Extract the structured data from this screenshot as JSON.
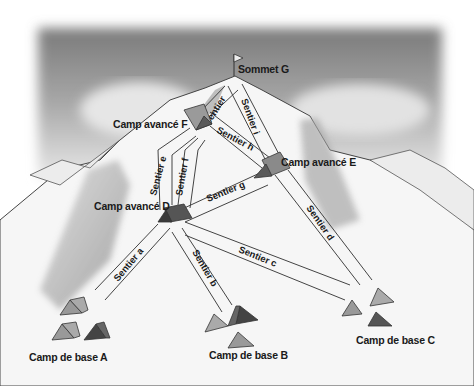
{
  "diagram": {
    "type": "mountain-route-map",
    "summit": {
      "label": "Sommet G"
    },
    "advanced_camps": [
      {
        "id": "D",
        "label": "Camp avancé D"
      },
      {
        "id": "E",
        "label": "Camp avancé E"
      },
      {
        "id": "F",
        "label": "Camp avancé F"
      }
    ],
    "base_camps": [
      {
        "id": "A",
        "label": "Camp de base A"
      },
      {
        "id": "B",
        "label": "Camp de base B"
      },
      {
        "id": "C",
        "label": "Camp de base C"
      }
    ],
    "trails": [
      {
        "id": "a",
        "label": "Sentier a",
        "from": "A",
        "to": "D"
      },
      {
        "id": "b",
        "label": "Sentier b",
        "from": "B",
        "to": "D"
      },
      {
        "id": "c",
        "label": "Sentier c",
        "from": "D",
        "to": "C"
      },
      {
        "id": "d",
        "label": "Sentier d",
        "from": "C",
        "to": "E"
      },
      {
        "id": "e",
        "label": "Sentier e",
        "from": "D",
        "to": "F"
      },
      {
        "id": "f",
        "label": "Sentier f",
        "from": "D",
        "to": "F"
      },
      {
        "id": "g",
        "label": "Sentier g",
        "from": "D",
        "to": "E"
      },
      {
        "id": "h",
        "label": "Sentier h",
        "from": "F",
        "to": "E"
      },
      {
        "id": "i",
        "label": "Sentier i",
        "from": "E",
        "to": "G"
      },
      {
        "id": "j",
        "label": "Sentier",
        "from": "F",
        "to": "G"
      }
    ]
  }
}
